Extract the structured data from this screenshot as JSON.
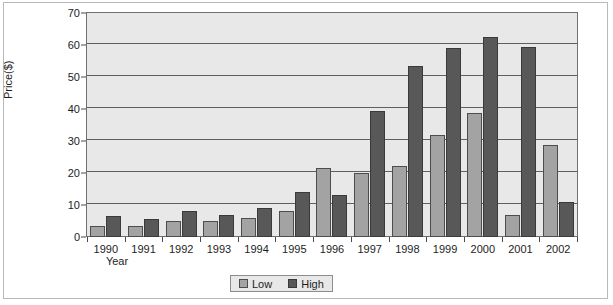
{
  "chart_data": {
    "type": "bar",
    "title": "",
    "xlabel": "Year",
    "ylabel": "Price($)",
    "ylim": [
      0,
      70
    ],
    "ytick_step": 10,
    "yticks": [
      0,
      10,
      20,
      30,
      40,
      50,
      60,
      70
    ],
    "grid": true,
    "legend_position": "bottom",
    "categories": [
      "1990",
      "1991",
      "1992",
      "1993",
      "1994",
      "1995",
      "1996",
      "1997",
      "1998",
      "1999",
      "2000",
      "2001",
      "2002"
    ],
    "series": [
      {
        "name": "Low",
        "color": "#a3a3a3",
        "values": [
          3.5,
          3.5,
          5.0,
          5.0,
          5.8,
          8.0,
          21.5,
          20.0,
          22.3,
          31.8,
          38.8,
          6.8,
          28.7
        ]
      },
      {
        "name": "High",
        "color": "#585858",
        "values": [
          6.5,
          5.5,
          8.2,
          7.0,
          9.0,
          14.0,
          13.0,
          39.5,
          53.5,
          59.0,
          62.5,
          59.5,
          11.0
        ]
      }
    ]
  },
  "colors": {
    "plot_background": "#e8e8e8",
    "gridline": "#5f5f5f",
    "axis": "#6f6f6f",
    "page_background": "#ffffff",
    "frame_border": "#b9b9b9",
    "text": "#1d1d1d"
  }
}
